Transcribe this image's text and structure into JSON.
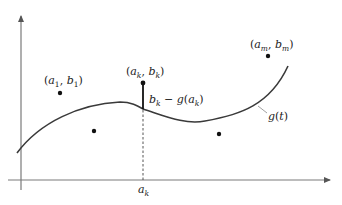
{
  "diagram": {
    "title": "",
    "colors": {
      "axis": "#7a7a7a",
      "curve": "#3a3a3a",
      "point": "#111111",
      "text": "#222222",
      "residual": "#111111",
      "dashed": "#555555"
    },
    "axes": {
      "origin": [
        21,
        180
      ],
      "y_top": 14,
      "x_right": 330
    },
    "curve": {
      "label": "g(t)",
      "label_name": "g",
      "label_arg": "t"
    },
    "points": [
      {
        "name": "a1-b1",
        "label_a": "a",
        "sub_a": "1",
        "label_b": "b",
        "sub_b": "1",
        "cx": 60,
        "cy": 93,
        "labeled": true
      },
      {
        "name": "unlabeled-left",
        "cx": 94,
        "cy": 131,
        "labeled": false
      },
      {
        "name": "ak-bk",
        "label_a": "a",
        "sub_a": "k",
        "label_b": "b",
        "sub_b": "k",
        "cx": 143,
        "cy": 83,
        "labeled": true
      },
      {
        "name": "unlabeled-right",
        "cx": 219,
        "cy": 134,
        "labeled": false
      },
      {
        "name": "am-bm",
        "label_a": "a",
        "sub_a": "m",
        "label_b": "b",
        "sub_b": "m",
        "cx": 268,
        "cy": 56,
        "labeled": true
      }
    ],
    "residual": {
      "label": "b_k − g(a_k)",
      "b": "b",
      "b_sub": "k",
      "minus": "−",
      "g": "g",
      "a": "a",
      "a_sub": "k"
    },
    "x_tick": {
      "label": "a",
      "sub": "k"
    },
    "labels": {
      "a1b1": {
        "open": "(",
        "a": "a",
        "a_sub": "1",
        "comma": ", ",
        "b": "b",
        "b_sub": "1",
        "close": ")"
      },
      "akbk": {
        "open": "(",
        "a": "a",
        "a_sub": "k",
        "comma": ", ",
        "b": "b",
        "b_sub": "k",
        "close": ")"
      },
      "ambm": {
        "open": "(",
        "a": "a",
        "a_sub": "m",
        "comma": ", ",
        "b": "b",
        "b_sub": "m",
        "close": ")"
      },
      "gt": {
        "g": "g",
        "open": "(",
        "t": "t",
        "close": ")"
      },
      "resid": {
        "b": "b",
        "b_sub": "k",
        "minus": " − ",
        "g": "g",
        "open": "(",
        "a": "a",
        "a_sub": "k",
        "close": ")"
      },
      "ak_axis": {
        "a": "a",
        "a_sub": "k"
      }
    }
  }
}
